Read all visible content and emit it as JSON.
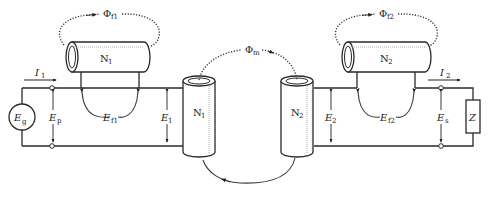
{
  "diagram": {
    "type": "transformer-equivalent-circuit",
    "colors": {
      "line": "#2a2a2a",
      "background": "#ffffff"
    },
    "source": {
      "label": "E",
      "sub": "g"
    },
    "load": {
      "label": "Z"
    },
    "currents": {
      "primary": {
        "label": "I",
        "sub": "1"
      },
      "secondary": {
        "label": "I",
        "sub": "2"
      }
    },
    "voltages": {
      "primary_terminal": {
        "label": "E",
        "sub": "p"
      },
      "primary_leakage": {
        "label": "E",
        "sub": "f1"
      },
      "primary_induced": {
        "label": "E",
        "sub": "1"
      },
      "secondary_induced": {
        "label": "E",
        "sub": "2"
      },
      "secondary_leakage": {
        "label": "E",
        "sub": "f2"
      },
      "secondary_terminal": {
        "label": "E",
        "sub": "s"
      }
    },
    "coils": {
      "primary_leakage": {
        "label": "N",
        "sub": "1"
      },
      "primary_main": {
        "label": "N",
        "sub": "1"
      },
      "secondary_main": {
        "label": "N",
        "sub": "2"
      },
      "secondary_leakage": {
        "label": "N",
        "sub": "2"
      }
    },
    "fluxes": {
      "primary_leakage": {
        "label": "Φ",
        "sub": "f1"
      },
      "mutual": {
        "label": "Φ",
        "sub": "m"
      },
      "secondary_leakage": {
        "label": "Φ",
        "sub": "f2"
      }
    }
  }
}
